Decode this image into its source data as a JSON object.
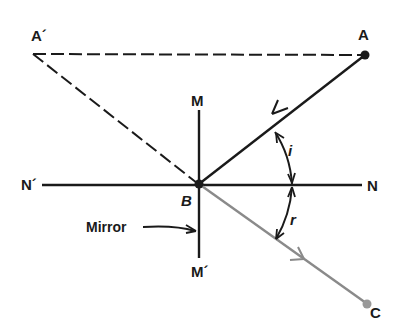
{
  "diagram": {
    "type": "ray-diagram-reflection",
    "labels": {
      "A_prime": "A´",
      "A": "A",
      "M": "M",
      "M_prime": "M´",
      "N_prime": "N´",
      "N": "N",
      "B": "B",
      "C": "C",
      "i": "i",
      "r": "r",
      "mirror": "Mirror"
    },
    "points": {
      "A_prime": [
        33,
        54
      ],
      "A": [
        365,
        55
      ],
      "B": [
        199,
        184
      ],
      "C": [
        368,
        305
      ]
    },
    "colors": {
      "ink": "#1a1a1a",
      "reflected_ray": "#8a8a8a",
      "point_C": "#999999"
    }
  }
}
